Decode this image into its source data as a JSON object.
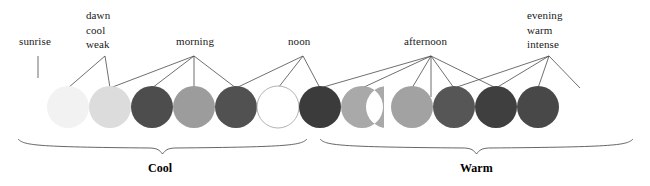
{
  "figure": {
    "title_text": "",
    "background": "#ffffff",
    "width": 650,
    "height": 186
  },
  "annotations": [
    {
      "id": "sunrise",
      "lines": [
        "sunrise"
      ],
      "x": 19,
      "y": 35,
      "anchor_x": 38,
      "anchor_y": 56,
      "connector_type": "vertical-tick",
      "targets": []
    },
    {
      "id": "dawn",
      "lines": [
        "dawn",
        "cool",
        "weak"
      ],
      "x": 86,
      "y": 8,
      "anchor_x": 105,
      "anchor_y": 56,
      "connector_type": "fan",
      "targets": [
        68,
        110
      ]
    },
    {
      "id": "morning",
      "lines": [
        "morning"
      ],
      "x": 176,
      "y": 35,
      "anchor_x": 194,
      "anchor_y": 56,
      "connector_type": "fan",
      "targets": [
        110,
        152,
        194,
        236
      ]
    },
    {
      "id": "noon",
      "lines": [
        "noon"
      ],
      "x": 288,
      "y": 35,
      "anchor_x": 303,
      "anchor_y": 56,
      "connector_type": "fan",
      "targets": [
        236,
        278,
        320
      ]
    },
    {
      "id": "afternoon",
      "lines": [
        "afternoon"
      ],
      "x": 404,
      "y": 35,
      "anchor_x": 431,
      "anchor_y": 56,
      "connector_type": "fan",
      "targets": [
        320,
        362,
        412,
        454,
        496
      ]
    },
    {
      "id": "evening",
      "lines": [
        "evening",
        "warm",
        "intense"
      ],
      "x": 527,
      "y": 8,
      "anchor_x": 549,
      "anchor_y": 56,
      "connector_type": "fan",
      "targets": [
        454,
        496,
        538,
        580
      ]
    }
  ],
  "circles": [
    {
      "index": 1,
      "cx": 68,
      "cy": 107,
      "r": 21,
      "fill": "#f2f2f2",
      "stroke": "none",
      "shape": "circle",
      "phase": "sunrise"
    },
    {
      "index": 2,
      "cx": 110,
      "cy": 107,
      "r": 21,
      "fill": "#dcdcdc",
      "stroke": "none",
      "shape": "circle",
      "phase": "dawn"
    },
    {
      "index": 3,
      "cx": 152,
      "cy": 107,
      "r": 21,
      "fill": "#4d4d4d",
      "stroke": "none",
      "shape": "circle",
      "phase": "morning"
    },
    {
      "index": 4,
      "cx": 194,
      "cy": 107,
      "r": 21,
      "fill": "#9c9c9c",
      "stroke": "none",
      "shape": "circle",
      "phase": "morning"
    },
    {
      "index": 5,
      "cx": 236,
      "cy": 107,
      "r": 21,
      "fill": "#515151",
      "stroke": "none",
      "shape": "circle",
      "phase": "morning"
    },
    {
      "index": 6,
      "cx": 278,
      "cy": 107,
      "r": 21,
      "fill": "#ffffff",
      "stroke": "#aaaaaa",
      "shape": "circle",
      "phase": "noon"
    },
    {
      "index": 7,
      "cx": 320,
      "cy": 107,
      "r": 21,
      "fill": "#3b3b3b",
      "stroke": "none",
      "shape": "circle",
      "phase": "afternoon"
    },
    {
      "index": 8,
      "cx": 362,
      "cy": 107,
      "r": 21,
      "fill": "#a9a9a9",
      "stroke": "none",
      "shape": "notched",
      "phase": "afternoon"
    },
    {
      "index": 9,
      "cx": 412,
      "cy": 107,
      "r": 21,
      "fill": "#a2a2a2",
      "stroke": "none",
      "shape": "circle",
      "phase": "afternoon"
    },
    {
      "index": 10,
      "cx": 454,
      "cy": 107,
      "r": 21,
      "fill": "#565656",
      "stroke": "none",
      "shape": "circle",
      "phase": "afternoon"
    },
    {
      "index": 11,
      "cx": 496,
      "cy": 107,
      "r": 21,
      "fill": "#3f3f3f",
      "stroke": "none",
      "shape": "circle",
      "phase": "evening"
    },
    {
      "index": 12,
      "cx": 538,
      "cy": 107,
      "r": 21,
      "fill": "#484848",
      "stroke": "none",
      "shape": "circle",
      "phase": "evening"
    }
  ],
  "groups": [
    {
      "id": "cool",
      "label": "Cool",
      "x_start": 18,
      "x_end": 307,
      "label_x": 148,
      "label_y": 161
    },
    {
      "id": "warm",
      "label": "Warm",
      "x_start": 320,
      "x_end": 633,
      "label_x": 460,
      "label_y": 161
    }
  ],
  "colors": {
    "line": "#4a4a4a",
    "text": "#1a1a1a",
    "brace": "#555555",
    "background": "#ffffff"
  }
}
